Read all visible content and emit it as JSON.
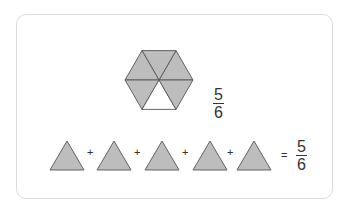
{
  "colors": {
    "shaded": "#bdbdbd",
    "stroke": "#555555",
    "unshaded": "#ffffff",
    "text": "#333333",
    "border": "#dcdcdc"
  },
  "hexagon": {
    "total_parts": 6,
    "shaded_parts": 5,
    "fraction": {
      "numerator": "5",
      "denominator": "6"
    }
  },
  "equation": {
    "terms": [
      "triangle",
      "triangle",
      "triangle",
      "triangle",
      "triangle"
    ],
    "operators": [
      "+",
      "+",
      "+",
      "+"
    ],
    "equals": "=",
    "result": {
      "numerator": "5",
      "denominator": "6"
    }
  }
}
